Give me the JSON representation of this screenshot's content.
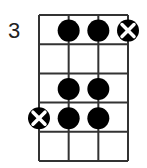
{
  "diagram": {
    "type": "chord-diagram",
    "starting_fret_label": "3",
    "strings": 4,
    "frets": 5,
    "colors": {
      "line": "#333333",
      "dot": "#000000",
      "mute_bg": "#000000",
      "mute_x": "#ffffff",
      "label": "#222222"
    },
    "markers": [
      {
        "fret": 1,
        "string": 2,
        "kind": "dot"
      },
      {
        "fret": 1,
        "string": 3,
        "kind": "dot"
      },
      {
        "fret": 1,
        "string": 4,
        "kind": "x-dot"
      },
      {
        "fret": 3,
        "string": 2,
        "kind": "dot"
      },
      {
        "fret": 3,
        "string": 3,
        "kind": "dot"
      },
      {
        "fret": 4,
        "string": 1,
        "kind": "x-dot"
      },
      {
        "fret": 4,
        "string": 2,
        "kind": "dot"
      },
      {
        "fret": 4,
        "string": 3,
        "kind": "dot"
      }
    ]
  }
}
